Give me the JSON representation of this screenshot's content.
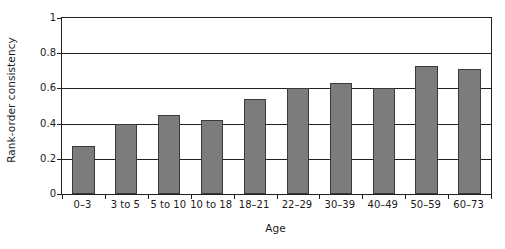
{
  "chart_data": {
    "type": "bar",
    "title": "",
    "xlabel": "Age",
    "ylabel": "Rank-order consistency",
    "categories": [
      "0–3",
      "3 to 5",
      "5 to 10",
      "10 to 18",
      "18–21",
      "22–29",
      "30–39",
      "40–49",
      "50–59",
      "60–73"
    ],
    "values": [
      0.27,
      0.4,
      0.45,
      0.42,
      0.54,
      0.6,
      0.63,
      0.6,
      0.73,
      0.71
    ],
    "ylim": [
      0,
      1
    ],
    "yticks": [
      "0",
      "0.2",
      "0.4",
      "0.6",
      "0.8",
      "1"
    ],
    "ytick_values": [
      0,
      0.2,
      0.4,
      0.6,
      0.8,
      1
    ],
    "grid": true,
    "grid_axis": "y",
    "legend": false,
    "bar_color": "#7c7c7c",
    "bar_edge_color": "#3a3a3a",
    "axis_color": "#231f20"
  }
}
